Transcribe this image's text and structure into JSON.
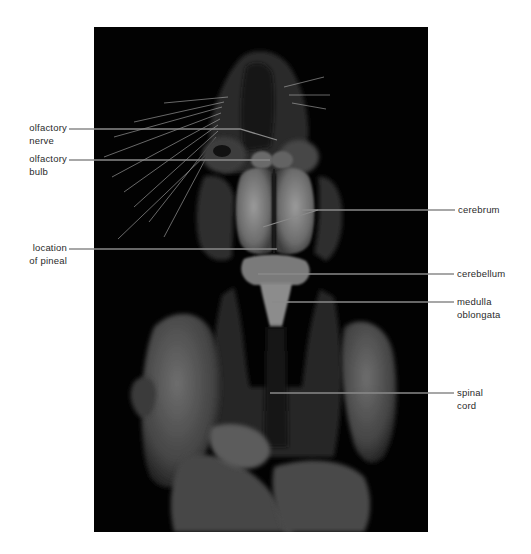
{
  "figure": {
    "background_color": "#ffffff",
    "photo_background": "#020202",
    "leader_line_color": "#8a8a8a",
    "label_color": "#2a2a2a"
  },
  "labels": {
    "left": [
      {
        "id": "olfactory-nerve",
        "line1": "olfactory",
        "line2": "nerve"
      },
      {
        "id": "olfactory-bulb",
        "line1": "olfactory",
        "line2": "bulb"
      },
      {
        "id": "location-of-pineal",
        "line1": "location",
        "line2": "of pineal"
      }
    ],
    "right": [
      {
        "id": "cerebrum",
        "line1": "cerebrum",
        "line2": ""
      },
      {
        "id": "cerebellum",
        "line1": "cerebellum",
        "line2": ""
      },
      {
        "id": "medulla-oblongata",
        "line1": "medulla",
        "line2": "oblongata"
      },
      {
        "id": "spinal-cord",
        "line1": "spinal",
        "line2": "cord"
      }
    ]
  }
}
